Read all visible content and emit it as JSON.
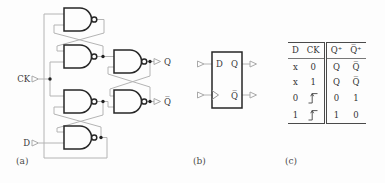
{
  "captions": {
    "a": "(a)",
    "b": "(b)",
    "c": "(c)"
  },
  "schematic": {
    "input_labels": {
      "ck": "CK",
      "d": "D"
    },
    "output_labels": {
      "q": "Q",
      "q_bar": "Q̅"
    },
    "gate_type": "nand-gate",
    "gate_count": 6
  },
  "symbol": {
    "d_label": "D",
    "q_label": "Q",
    "q_bar_label": "Q̅",
    "clock_input_icon": "edge-trigger-triangle"
  },
  "truth_table": {
    "columns": [
      "D",
      "CK",
      "Q⁺",
      "Q̅⁺"
    ],
    "rows": [
      [
        "x",
        "0",
        "Q",
        "Q̅"
      ],
      [
        "x",
        "1",
        "Q",
        "Q̅"
      ],
      [
        "0",
        "rising-edge",
        "0",
        "1"
      ],
      [
        "1",
        "rising-edge",
        "1",
        "0"
      ]
    ],
    "ck_edge_icon": "rising-edge"
  },
  "colors": {
    "gate_stroke": "#262626",
    "wire": "#b4b4b4",
    "connector": "#a9a9a9",
    "text": "#3a3a3a",
    "table_rule": "#4a4a4a"
  }
}
